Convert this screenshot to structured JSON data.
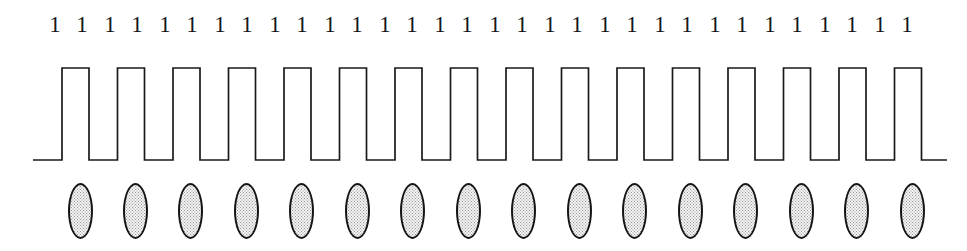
{
  "figure": {
    "type": "waveform-diagram",
    "width": 967,
    "height": 251,
    "background_color": "#ffffff"
  },
  "bit_labels": {
    "name": "bit-sequence",
    "count": 32,
    "values": [
      "1",
      "1",
      "1",
      "1",
      "1",
      "1",
      "1",
      "1",
      "1",
      "1",
      "1",
      "1",
      "1",
      "1",
      "1",
      "1",
      "1",
      "1",
      "1",
      "1",
      "1",
      "1",
      "1",
      "1",
      "1",
      "1",
      "1",
      "1",
      "1",
      "1",
      "1",
      "1"
    ],
    "x_positions": [
      55,
      82,
      110,
      137,
      165,
      192,
      220,
      247,
      275,
      302,
      330,
      357,
      385,
      412,
      440,
      467,
      495,
      522,
      550,
      577,
      605,
      632,
      660,
      687,
      715,
      742,
      770,
      797,
      825,
      852,
      880,
      907
    ],
    "text_color": "#171717",
    "font_size_px": 23
  },
  "waveform": {
    "name": "square-wave",
    "pulse_count": 16,
    "line_color": "#1a1a1a",
    "line_width_px": 1.7,
    "high_level_y": 18,
    "low_level_y": 110,
    "lead_in_start_x": 33,
    "first_rise_x": 62,
    "period_px": 55.5,
    "high_width_px": 27,
    "tail_end_x": 947,
    "states": [
      "high",
      "high",
      "high",
      "high",
      "high",
      "high",
      "high",
      "high",
      "high",
      "high",
      "high",
      "high",
      "high",
      "high",
      "high",
      "high"
    ]
  },
  "bit_cells": {
    "name": "bit-cell-ellipses",
    "count": 16,
    "fill_color": "#f2f2f2",
    "stipple_color": "#9a9a9a",
    "border_color": "#141414",
    "width_px": 25,
    "height_px": 56,
    "x_positions": [
      68,
      123,
      178,
      234,
      289,
      345,
      400,
      456,
      511,
      567,
      622,
      678,
      733,
      789,
      844,
      900
    ]
  }
}
